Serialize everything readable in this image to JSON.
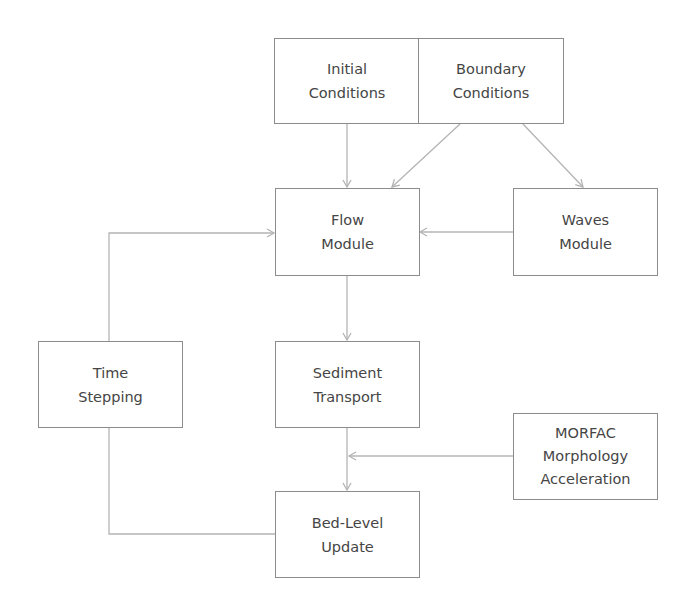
{
  "diagram": {
    "colors": {
      "box_border": "#8c8c8c",
      "connector": "#b4b4b4",
      "text": "#454545",
      "background": "#ffffff"
    },
    "nodes": {
      "initial_conditions": {
        "line1": "Initial",
        "line2": "Conditions"
      },
      "boundary_conditions": {
        "line1": "Boundary",
        "line2": "Conditions"
      },
      "flow_module": {
        "line1": "Flow",
        "line2": "Module"
      },
      "waves_module": {
        "line1": "Waves",
        "line2": "Module"
      },
      "time_stepping": {
        "line1": "Time",
        "line2": "Stepping"
      },
      "sediment_transport": {
        "line1": "Sediment",
        "line2": "Transport"
      },
      "morfac": {
        "line1": "MORFAC",
        "line2": "Morphology",
        "line3": "Acceleration"
      },
      "bed_level_update": {
        "line1": "Bed-Level",
        "line2": "Update"
      }
    },
    "edges": [
      {
        "from": "Initial Conditions",
        "to": "Flow Module"
      },
      {
        "from": "Boundary Conditions",
        "to": "Flow Module"
      },
      {
        "from": "Boundary Conditions",
        "to": "Waves Module"
      },
      {
        "from": "Waves Module",
        "to": "Flow Module"
      },
      {
        "from": "Flow Module",
        "to": "Sediment Transport"
      },
      {
        "from": "Sediment Transport",
        "to": "Bed-Level Update"
      },
      {
        "from": "MORFAC Morphology Acceleration",
        "to": "Sediment-to-Bed-Level link"
      },
      {
        "from": "Bed-Level Update",
        "to": "Time Stepping"
      },
      {
        "from": "Time Stepping",
        "to": "Flow Module"
      }
    ]
  }
}
